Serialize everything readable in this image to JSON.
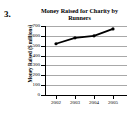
{
  "problem": {
    "number": "3."
  },
  "chart_data": {
    "type": "line",
    "title": "Money Raised for Charity by Runners",
    "title_line1": "Money Raised for Charity by",
    "title_line2": "Runners",
    "xlabel": "",
    "ylabel": "Money Raised ($ millions)",
    "categories": [
      "2002",
      "2003",
      "2004",
      "2005"
    ],
    "x_tick_labels": [
      "2002",
      "2003",
      "2004",
      "2005"
    ],
    "values": [
      520,
      580,
      600,
      670
    ],
    "ylim": [
      0,
      700
    ],
    "y_tick_labels": [
      "700",
      "600",
      "500",
      "400",
      "300",
      "200",
      "100",
      "0"
    ],
    "y_tick_values": [
      700,
      600,
      500,
      400,
      300,
      200,
      100,
      0
    ],
    "grid": true,
    "legend": false,
    "series": [
      {
        "name": "Money Raised",
        "values": [
          520,
          580,
          600,
          670
        ]
      }
    ],
    "colors": {
      "line": "#000000",
      "marker": "#000000",
      "grid": "#a8a8a8",
      "axis": "#000000",
      "background": "#ffffff"
    }
  }
}
